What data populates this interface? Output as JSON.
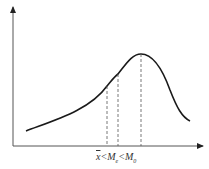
{
  "diagram": {
    "type": "skewed-distribution-curve",
    "axes": {
      "x_axis": "horizontal arrow",
      "y_axis": "vertical arrow"
    },
    "label": {
      "mean": "x",
      "lt1": "<",
      "median": "M",
      "median_sub": "e",
      "lt2": "<",
      "mode": "M",
      "mode_sub": "0"
    },
    "markers": [
      {
        "name": "mean",
        "x": 107
      },
      {
        "name": "median",
        "x": 118
      },
      {
        "name": "mode",
        "x": 141
      }
    ],
    "colors": {
      "line": "#1a1a1a",
      "axis": "#333333",
      "dash": "#555555"
    }
  }
}
